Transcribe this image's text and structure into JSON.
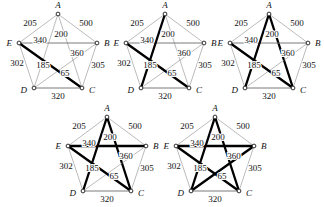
{
  "figure": {
    "title": ""
  },
  "chart_data": {
    "type": "diagram",
    "title": "",
    "xlabel": "",
    "ylabel": "",
    "vertices": [
      {
        "id": "A",
        "label": "A",
        "x": 55,
        "y": 14
      },
      {
        "id": "B",
        "label": "B",
        "x": 94,
        "y": 43
      },
      {
        "id": "C",
        "label": "C",
        "x": 79,
        "y": 88
      },
      {
        "id": "D",
        "label": "D",
        "x": 31,
        "y": 88
      },
      {
        "id": "E",
        "label": "E",
        "x": 16,
        "y": 43
      }
    ],
    "edges": [
      {
        "id": "AE",
        "from": "A",
        "to": "E",
        "weight": 205,
        "label": "205",
        "lx": 27,
        "ly": 26
      },
      {
        "id": "AB",
        "from": "A",
        "to": "B",
        "weight": 500,
        "label": "500",
        "lx": 83,
        "ly": 26
      },
      {
        "id": "AC",
        "from": "A",
        "to": "C",
        "weight": 200,
        "label": "200",
        "lx": 58,
        "ly": 37
      },
      {
        "id": "EB",
        "from": "E",
        "to": "B",
        "weight": 340,
        "label": "340",
        "lx": 37,
        "ly": 43
      },
      {
        "id": "DB",
        "from": "D",
        "to": "B",
        "weight": 360,
        "label": "360",
        "lx": 74,
        "ly": 56
      },
      {
        "id": "ED",
        "from": "E",
        "to": "D",
        "weight": 302,
        "label": "302",
        "lx": 14,
        "ly": 66
      },
      {
        "id": "AD",
        "from": "A",
        "to": "D",
        "weight": 185,
        "label": "185",
        "lx": 40,
        "ly": 68
      },
      {
        "id": "EC",
        "from": "E",
        "to": "C",
        "weight": 65,
        "label": "65",
        "lx": 62,
        "ly": 76
      },
      {
        "id": "BC",
        "from": "B",
        "to": "C",
        "weight": 305,
        "label": "305",
        "lx": 95,
        "ly": 68
      },
      {
        "id": "DC",
        "from": "D",
        "to": "C",
        "weight": 320,
        "label": "320",
        "lx": 55,
        "ly": 99
      }
    ],
    "panels": [
      {
        "name": "panel-1",
        "index": 1,
        "selected_edges": [
          "EC"
        ],
        "left": 3,
        "top": 0
      },
      {
        "name": "panel-2",
        "index": 2,
        "selected_edges": [
          "EC",
          "AD"
        ],
        "left": 110,
        "top": 0
      },
      {
        "name": "panel-3",
        "index": 3,
        "selected_edges": [
          "EC",
          "AD",
          "AC"
        ],
        "left": 214,
        "top": 0
      },
      {
        "name": "panel-4",
        "index": 4,
        "selected_edges": [
          "EC",
          "AD",
          "AC",
          "EB"
        ],
        "left": 52,
        "top": 103
      },
      {
        "name": "panel-5",
        "index": 5,
        "selected_edges": [
          "EC",
          "AD",
          "AC",
          "EB",
          "DB"
        ],
        "left": 160,
        "top": 103
      }
    ],
    "emphasized_edges": [
      "EB",
      "DC"
    ],
    "colors": {
      "bold_edge": "#000000",
      "thin_edge": "#8d8d8d",
      "mid_edge": "#6b6b6b",
      "vertex_fill": "#ffffff",
      "vertex_stroke": "#1a1a1a",
      "text": "#111111",
      "background": "#ffffff"
    }
  }
}
